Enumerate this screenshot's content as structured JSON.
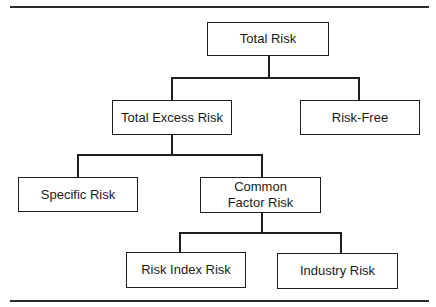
{
  "diagram": {
    "type": "tree",
    "nodes": {
      "total_risk": "Total Risk",
      "total_excess_risk": "Total Excess Risk",
      "risk_free": "Risk-Free",
      "specific_risk": "Specific Risk",
      "common_factor_risk": "Common Factor Risk",
      "risk_index_risk": "Risk Index Risk",
      "industry_risk": "Industry Risk"
    },
    "edges": [
      [
        "Total Risk",
        "Total Excess Risk"
      ],
      [
        "Total Risk",
        "Risk-Free"
      ],
      [
        "Total Excess Risk",
        "Specific Risk"
      ],
      [
        "Total Excess Risk",
        "Common Factor Risk"
      ],
      [
        "Common Factor Risk",
        "Risk Index Risk"
      ],
      [
        "Common Factor Risk",
        "Industry Risk"
      ]
    ]
  }
}
